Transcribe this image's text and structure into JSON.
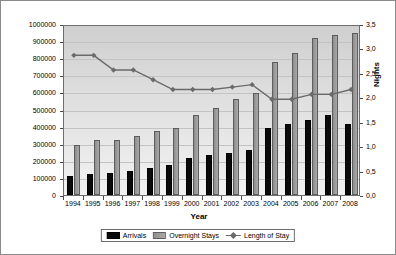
{
  "chart_data": {
    "type": "bar",
    "title": "",
    "xlabel": "Year",
    "ylabel": "",
    "y2label": "Nights",
    "categories": [
      "1994",
      "1995",
      "1996",
      "1997",
      "1998",
      "1999",
      "2000",
      "2001",
      "2002",
      "2003",
      "2004",
      "2005",
      "2006",
      "2007",
      "2008"
    ],
    "ylim": [
      0,
      1000000
    ],
    "yticks": [
      "0",
      "100000",
      "200000",
      "300000",
      "400000",
      "500000",
      "600000",
      "700000",
      "800000",
      "900000",
      "1000000"
    ],
    "y2lim": [
      0,
      3.5
    ],
    "y2ticks": [
      "0,0",
      "0,5",
      "1,0",
      "1,5",
      "2,0",
      "2,5",
      "3,0",
      "3,5"
    ],
    "grid": true,
    "legend_position": "bottom",
    "series": [
      {
        "name": "Arrivals",
        "axis": "left",
        "type": "bar",
        "color": "#0a0a0a",
        "values": [
          110000,
          120000,
          130000,
          140000,
          160000,
          175000,
          215000,
          235000,
          245000,
          265000,
          390000,
          415000,
          440000,
          470000,
          415000
        ]
      },
      {
        "name": "Overnight Stays",
        "axis": "left",
        "type": "bar",
        "color": "#9c9c9c",
        "values": [
          290000,
          320000,
          320000,
          345000,
          375000,
          390000,
          470000,
          510000,
          560000,
          595000,
          775000,
          830000,
          920000,
          935000,
          945000
        ]
      },
      {
        "name": "Length of Stay",
        "axis": "right",
        "type": "line",
        "color": "#6a6a6a",
        "values": [
          2.9,
          2.9,
          2.6,
          2.6,
          2.4,
          2.2,
          2.2,
          2.2,
          2.25,
          2.3,
          2.0,
          2.0,
          2.1,
          2.1,
          2.2
        ]
      }
    ]
  },
  "legend": {
    "arrivals_label": "Arrivals",
    "overnight_label": "Overnight Stays",
    "length_label": "Length of Stay"
  }
}
